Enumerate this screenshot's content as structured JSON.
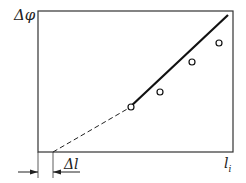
{
  "diagram": {
    "y_axis_label": "Δφ",
    "x_axis_label": "l",
    "x_axis_label_sub": "i",
    "offset_label": "Δl",
    "colors": {
      "line": "#111111",
      "frame": "#333333",
      "background": "#ffffff"
    },
    "data_points": [
      {
        "x": 131,
        "y": 107
      },
      {
        "x": 160,
        "y": 92
      },
      {
        "x": 192,
        "y": 62
      },
      {
        "x": 219,
        "y": 43
      }
    ]
  }
}
